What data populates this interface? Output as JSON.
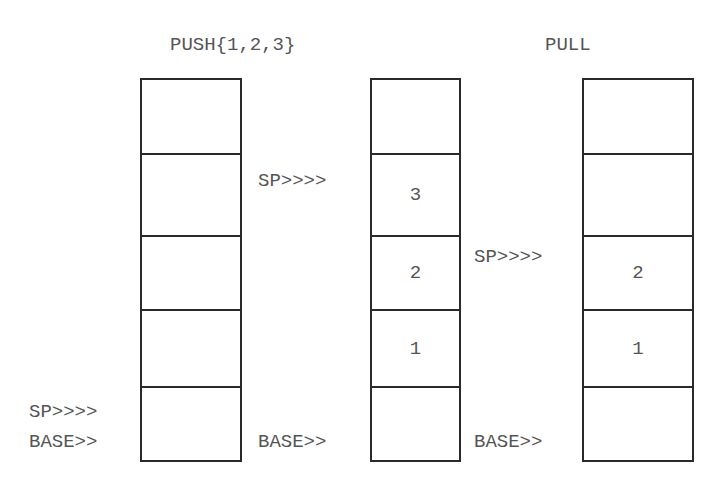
{
  "titles": {
    "push": "PUSH{1,2,3}",
    "pull": "PULL"
  },
  "stacks": [
    {
      "name": "initial",
      "cells": [
        "",
        "",
        "",
        "",
        ""
      ],
      "sp_label": "SP>>>>",
      "base_label": "BASE>>"
    },
    {
      "name": "after-push",
      "cells": [
        "",
        "3",
        "2",
        "1",
        ""
      ],
      "sp_label": "SP>>>>",
      "base_label": "BASE>>"
    },
    {
      "name": "after-pull",
      "cells": [
        "",
        "",
        "2",
        "1",
        ""
      ],
      "sp_label": "SP>>>>",
      "base_label": "BASE>>"
    }
  ],
  "colors": {
    "border": "#2a2a2a",
    "text": "#555555",
    "background": "#ffffff"
  }
}
